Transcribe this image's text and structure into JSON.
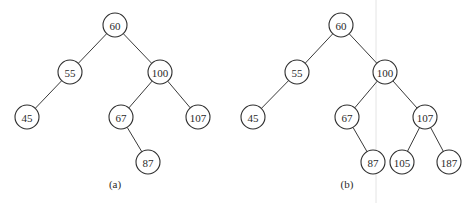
{
  "figure": {
    "node_radius": 12,
    "colors": {
      "stroke": "#2e2e2e",
      "text": "#2a2a2a",
      "background": "#ffffff"
    },
    "trees": [
      {
        "id": "a",
        "caption": "(a)",
        "caption_pos": [
          115,
          184
        ],
        "nodes": [
          {
            "id": "a60",
            "label": "60",
            "x": 115,
            "y": 25
          },
          {
            "id": "a55",
            "label": "55",
            "x": 70,
            "y": 72
          },
          {
            "id": "a100",
            "label": "100",
            "x": 160,
            "y": 72
          },
          {
            "id": "a45",
            "label": "45",
            "x": 27,
            "y": 117
          },
          {
            "id": "a67",
            "label": "67",
            "x": 121,
            "y": 117
          },
          {
            "id": "a107",
            "label": "107",
            "x": 198,
            "y": 117
          },
          {
            "id": "a87",
            "label": "87",
            "x": 148,
            "y": 162
          }
        ],
        "edges": [
          [
            "a60",
            "a55"
          ],
          [
            "a60",
            "a100"
          ],
          [
            "a55",
            "a45"
          ],
          [
            "a100",
            "a67"
          ],
          [
            "a100",
            "a107"
          ],
          [
            "a67",
            "a87"
          ]
        ]
      },
      {
        "id": "b",
        "caption": "(b)",
        "caption_pos": [
          347,
          184
        ],
        "nodes": [
          {
            "id": "b60",
            "label": "60",
            "x": 341,
            "y": 25
          },
          {
            "id": "b55",
            "label": "55",
            "x": 297,
            "y": 72
          },
          {
            "id": "b100",
            "label": "100",
            "x": 385,
            "y": 72
          },
          {
            "id": "b45",
            "label": "45",
            "x": 253,
            "y": 117
          },
          {
            "id": "b67",
            "label": "67",
            "x": 347,
            "y": 117
          },
          {
            "id": "b107",
            "label": "107",
            "x": 425,
            "y": 117
          },
          {
            "id": "b87",
            "label": "87",
            "x": 373,
            "y": 162
          },
          {
            "id": "b105",
            "label": "105",
            "x": 402,
            "y": 162
          },
          {
            "id": "b187",
            "label": "187",
            "x": 449,
            "y": 162
          }
        ],
        "edges": [
          [
            "b60",
            "b55"
          ],
          [
            "b60",
            "b100"
          ],
          [
            "b55",
            "b45"
          ],
          [
            "b100",
            "b67"
          ],
          [
            "b100",
            "b107"
          ],
          [
            "b67",
            "b87"
          ],
          [
            "b107",
            "b105"
          ],
          [
            "b107",
            "b187"
          ]
        ]
      }
    ]
  }
}
